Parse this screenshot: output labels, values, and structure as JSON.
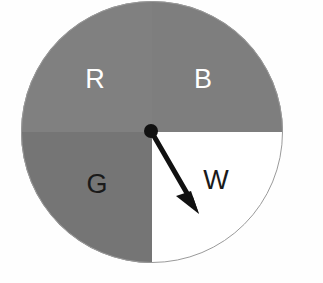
{
  "figure": {
    "kind": "probability-spinner",
    "background_color": "#fefefe",
    "outline_color": "#9a9a9a"
  },
  "spinner": {
    "center_x": 152,
    "center_y": 132,
    "radius": 131,
    "sectors": [
      {
        "id": "red",
        "label": "R",
        "position": "top-left",
        "fill": "#808080",
        "label_color": "#ffffff",
        "label_x": 95,
        "label_y": 81,
        "start_angle": 180,
        "end_angle": 270,
        "fraction": 0.25
      },
      {
        "id": "blue",
        "label": "B",
        "position": "top-right",
        "fill": "#7e7e7e",
        "label_color": "#ffffff",
        "label_x": 203,
        "label_y": 81,
        "start_angle": 270,
        "end_angle": 360,
        "fraction": 0.25
      },
      {
        "id": "green",
        "label": "G",
        "position": "bottom-left",
        "fill": "#757575",
        "label_color": "#1a1a1a",
        "label_x": 97,
        "label_y": 186,
        "start_angle": 90,
        "end_angle": 180,
        "fraction": 0.25
      },
      {
        "id": "white",
        "label": "W",
        "position": "bottom-right",
        "fill": "#ffffff",
        "label_color": "#1a1a1a",
        "label_x": 216,
        "label_y": 182,
        "start_angle": 0,
        "end_angle": 90,
        "fraction": 0.25
      }
    ]
  },
  "pointer": {
    "color": "#111111",
    "pivot_x": 151,
    "pivot_y": 131,
    "pivot_radius": 7,
    "tip_x": 199,
    "tip_y": 214,
    "shaft_width": 5,
    "head_length": 26,
    "head_width": 19,
    "points_to_sector": "W"
  }
}
